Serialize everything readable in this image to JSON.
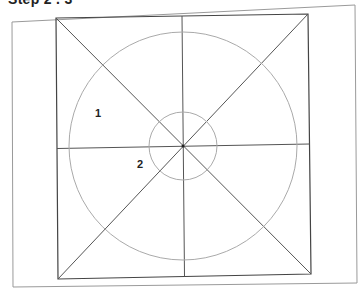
{
  "heading": "Step 2 . 3",
  "diagram": {
    "labels": [
      {
        "id": "1",
        "text": "1",
        "x": 98,
        "y": 117
      },
      {
        "id": "2",
        "text": "2",
        "x": 140,
        "y": 168
      }
    ],
    "colors": {
      "frame": "#9a9a9a",
      "square": "#444444",
      "lines": "#555555",
      "circles": "#aaaaaa",
      "text": "#222222"
    },
    "outer_frame": {
      "points": "12,22 355,5 357,283 13,287"
    },
    "inner_square": {
      "points": "56,18 308,14 311,274 58,279"
    },
    "center": {
      "x": 183,
      "y": 146
    },
    "large_circle_r": 114,
    "small_circle_r": 34
  }
}
